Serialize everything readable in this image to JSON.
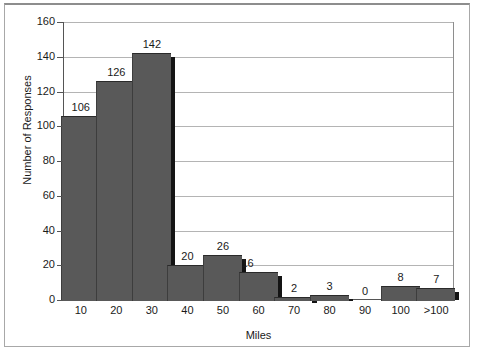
{
  "chart_data": {
    "type": "bar",
    "title": "",
    "xlabel": "Miles",
    "ylabel": "Number of Responses",
    "categories": [
      "10",
      "20",
      "30",
      "40",
      "50",
      "60",
      "70",
      "80",
      "90",
      "100",
      ">100"
    ],
    "values": [
      106,
      126,
      142,
      20,
      26,
      16,
      2,
      3,
      0,
      8,
      7
    ],
    "data_labels": [
      "106",
      "126",
      "142",
      "20",
      "26",
      "16",
      "2",
      "3",
      "0",
      "8",
      "7"
    ],
    "ylim": [
      0,
      160
    ],
    "ytick_labels": [
      "0",
      "20",
      "40",
      "60",
      "80",
      "100",
      "120",
      "140",
      "160"
    ],
    "ytick_values": [
      0,
      20,
      40,
      60,
      80,
      100,
      120,
      140,
      160
    ],
    "grid": "horizontal",
    "legend": "none",
    "bar_color": "#595959",
    "bar_shadow_color": "#141414",
    "gridline_color": "#b4b4b4",
    "axis_color": "#555555",
    "background_color": "#ffffff",
    "text_color": "#1a1a1a"
  }
}
